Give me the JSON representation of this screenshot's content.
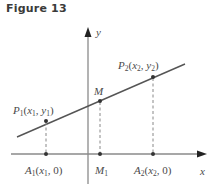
{
  "figure": {
    "title": "Figure 13"
  },
  "axes": {
    "x_label": "x",
    "y_label": "y"
  },
  "points": {
    "P1": {
      "name": "P",
      "sub": "1",
      "coords": "(x1, y1)",
      "x_var": "x",
      "x_sub": "1",
      "y_var": "y",
      "y_sub": "1"
    },
    "P2": {
      "name": "P",
      "sub": "2",
      "coords": "(x2, y2)",
      "x_var": "x",
      "x_sub": "2",
      "y_var": "y",
      "y_sub": "2"
    },
    "M": {
      "name": "M"
    },
    "A1": {
      "name": "A",
      "sub": "1",
      "x_var": "x",
      "x_sub": "1",
      "zero": "0"
    },
    "M1": {
      "name": "M",
      "sub": "1"
    },
    "A2": {
      "name": "A",
      "sub": "2",
      "x_var": "x",
      "x_sub": "2",
      "zero": "0"
    }
  },
  "colors": {
    "line": "#555555",
    "axis": "#7a7a7a",
    "dashed": "#888888",
    "dot": "#333333",
    "text": "#4a4a4a"
  }
}
